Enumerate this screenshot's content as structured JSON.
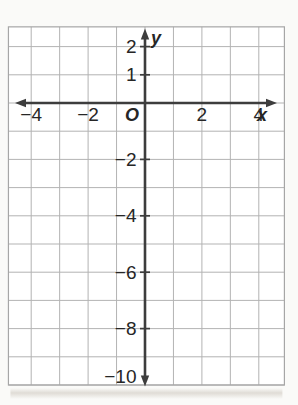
{
  "chart_data": {
    "type": "scatter",
    "points": [],
    "title": "",
    "xlabel": "x",
    "ylabel": "y",
    "origin_label": "O",
    "x_ticks": [
      {
        "value": -4,
        "label": "−4"
      },
      {
        "value": -2,
        "label": "−2"
      },
      {
        "value": 2,
        "label": "2"
      },
      {
        "value": 4,
        "label": "4"
      }
    ],
    "y_ticks": [
      {
        "value": 2,
        "label": "2"
      },
      {
        "value": 1,
        "label": "1"
      },
      {
        "value": -2,
        "label": "−2"
      },
      {
        "value": -4,
        "label": "−4"
      },
      {
        "value": -6,
        "label": "−6"
      },
      {
        "value": -8,
        "label": "−8"
      },
      {
        "value": -10,
        "label": "−10"
      }
    ],
    "xlim": [
      -4.8,
      4.9
    ],
    "ylim": [
      -10,
      2.7
    ],
    "grid": true,
    "grid_step": 1,
    "legend": "none"
  },
  "colors": {
    "grid_line": "#b3b3b3",
    "grid_border": "#a6a6a6",
    "axis": "#3d3d3d",
    "label": "#262626",
    "background": "#ffffff",
    "page_background": "#fafaf8",
    "shadow": "#b4ab9e"
  }
}
